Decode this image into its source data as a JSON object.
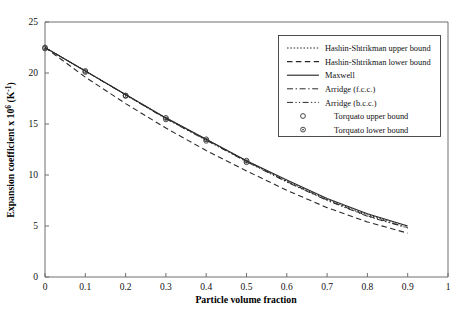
{
  "chart_data": {
    "type": "line",
    "title": "",
    "xlabel": "Particle volume fraction",
    "ylabel": "Expansion coefficient x 10⁶ (K⁻¹)",
    "xlim": [
      0,
      1
    ],
    "ylim": [
      0,
      25
    ],
    "xticks": [
      "0",
      "0.1",
      "0.2",
      "0.3",
      "0.4",
      "0.5",
      "0.6",
      "0.7",
      "0.8",
      "0.9",
      "1"
    ],
    "xtick_values": [
      0,
      0.1,
      0.2,
      0.3,
      0.4,
      0.5,
      0.6,
      0.7,
      0.8,
      0.9,
      1
    ],
    "yticks": [
      "0",
      "5",
      "10",
      "15",
      "20",
      "25"
    ],
    "ytick_values": [
      0,
      5,
      10,
      15,
      20,
      25
    ],
    "grid": false,
    "legend_position": "top-right",
    "x": [
      0,
      0.1,
      0.2,
      0.3,
      0.4,
      0.5,
      0.6,
      0.7,
      0.8,
      0.9
    ],
    "series": [
      {
        "name": "Hashin-Shtrikman upper bound",
        "style": "dotted",
        "values": [
          22.5,
          20.2,
          17.9,
          15.6,
          13.5,
          11.4,
          9.4,
          7.6,
          6.1,
          5.0
        ]
      },
      {
        "name": "Hashin-Shtrikman lower bound",
        "style": "dashed",
        "values": [
          22.5,
          19.6,
          17.0,
          14.6,
          12.4,
          10.4,
          8.5,
          6.8,
          5.4,
          4.3
        ]
      },
      {
        "name": "Maxwell",
        "style": "solid",
        "values": [
          22.5,
          20.2,
          17.9,
          15.6,
          13.5,
          11.4,
          9.5,
          7.7,
          6.2,
          5.0
        ]
      },
      {
        "name": "Arridge (f.c.c.)",
        "style": "dash-dot",
        "values": [
          22.5,
          20.2,
          17.85,
          15.55,
          13.45,
          11.35,
          9.35,
          7.55,
          6.0,
          4.85
        ]
      },
      {
        "name": "Arridge (b.c.c.)",
        "style": "dash-dot-dot",
        "values": [
          22.5,
          20.2,
          17.85,
          15.5,
          13.4,
          11.3,
          9.3,
          7.5,
          5.95,
          4.8
        ]
      }
    ],
    "markers": [
      {
        "name": "Torquato  upper bound",
        "style": "open-circle",
        "x": [
          0,
          0.1,
          0.2,
          0.3,
          0.4,
          0.5
        ],
        "values": [
          22.5,
          20.2,
          17.8,
          15.6,
          13.5,
          11.4
        ]
      },
      {
        "name": "Torquato lower bound",
        "style": "dotted-circle",
        "x": [
          0,
          0.1,
          0.2,
          0.3,
          0.4,
          0.5
        ],
        "values": [
          22.4,
          20.1,
          17.75,
          15.45,
          13.35,
          11.25
        ]
      }
    ]
  },
  "legend": {
    "entries": [
      {
        "label": "Hashin-Shtrikman upper bound",
        "marker": "line-dotted"
      },
      {
        "label": "Hashin-Shtrikman lower bound",
        "marker": "line-dashed"
      },
      {
        "label": "Maxwell",
        "marker": "line-solid"
      },
      {
        "label": "Arridge (f.c.c.)",
        "marker": "line-dash-dot"
      },
      {
        "label": "Arridge (b.c.c.)",
        "marker": "line-dash-dot-dot"
      },
      {
        "label": "Torquato  upper bound",
        "marker": "open-circle"
      },
      {
        "label": "Torquato lower bound",
        "marker": "dotted-circle"
      }
    ]
  },
  "colors": {
    "axis": "#6e6e6e",
    "curve": "#2a2a2a",
    "text": "#111111",
    "background": "#ffffff",
    "legend_border": "#3a3a3a"
  }
}
